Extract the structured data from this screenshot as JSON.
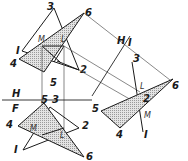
{
  "diagram": {
    "fold_lines": {
      "hf": {
        "upper_label": "H",
        "lower_label": "F"
      },
      "h1": {
        "label_h": "H",
        "label_1": "I"
      }
    },
    "top_view": {
      "points": {
        "p1": "I",
        "p2": "2",
        "p3": "3",
        "p4": "4",
        "p5": "5",
        "p6": "6"
      },
      "intersection": {
        "m": "M",
        "l": "L"
      }
    },
    "front_view": {
      "points": {
        "p1": "I",
        "p2": "2",
        "p3": "3",
        "p4": "4",
        "p5": "5",
        "p6": "6"
      },
      "intersection": {
        "m": "M",
        "l": "L"
      }
    },
    "aux_view": {
      "points": {
        "p1": "I",
        "p2": "2",
        "p3": "3",
        "p4": "4",
        "p5": "5",
        "p6": "6"
      },
      "intersection": {
        "m": "M",
        "l": "L"
      }
    }
  }
}
